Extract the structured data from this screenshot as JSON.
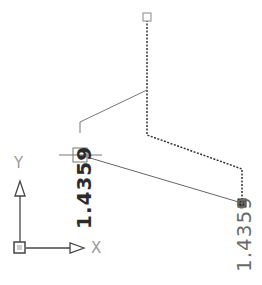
{
  "drawing": {
    "dimension_left": "1.4359",
    "dimension_right": "1.4359",
    "colors": {
      "solid_line": "#6e6e6e",
      "dashed_line": "#333333",
      "grip_filled": "#333333",
      "ucs_icon": "#444444",
      "axis_label": "#9a9a9a"
    }
  },
  "ucs_icon": {
    "x_label": "X",
    "y_label": "Y"
  }
}
